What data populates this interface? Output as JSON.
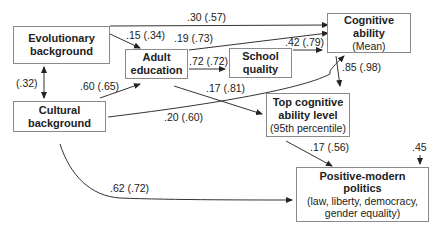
{
  "nodes": {
    "evolutionary": {
      "title_line1": "Evolutionary",
      "title_line2": "background"
    },
    "cultural": {
      "title_line1": "Cultural",
      "title_line2": "background"
    },
    "adult_education": {
      "title_line1": "Adult",
      "title_line2": "education"
    },
    "school_quality": {
      "title_line1": "School",
      "title_line2": "quality"
    },
    "cognitive_ability": {
      "title_line1": "Cognitive",
      "title_line2": "ability",
      "subtitle": "(Mean)"
    },
    "top_cognitive": {
      "title_line1": "Top cognitive",
      "title_line2": "ability level",
      "subtitle": "(95th percentile)"
    },
    "politics": {
      "title_line1": "Positive-modern",
      "title_line2": "politics",
      "subtitle_line1": "(law, liberty, democracy,",
      "subtitle_line2": "gender equality)"
    }
  },
  "edges": [
    {
      "from": "evolutionary",
      "to": "cognitive_ability",
      "label": ".30 (.57)"
    },
    {
      "from": "evolutionary",
      "to": "adult_education",
      "label": ".15 (.34)"
    },
    {
      "from": "adult_education",
      "to": "cognitive_ability",
      "label": ".19 (.73)"
    },
    {
      "from": "evolutionary",
      "to": "cultural",
      "label": "(.32)",
      "bidirectional": true
    },
    {
      "from": "cultural",
      "to": "adult_education",
      "label": ".60 (.65)"
    },
    {
      "from": "adult_education",
      "to": "school_quality",
      "label": ".72 (.72)"
    },
    {
      "from": "school_quality",
      "to": "cognitive_ability",
      "label": ".42 (.79)"
    },
    {
      "from": "adult_education",
      "to": "top_cognitive",
      "label": ".17 (.81)"
    },
    {
      "from": "cultural",
      "to": "cognitive_ability",
      "label": ".20 (.60)"
    },
    {
      "from": "cognitive_ability",
      "to": "top_cognitive",
      "label": ".85 (.98)"
    },
    {
      "from": "top_cognitive",
      "to": "politics",
      "label": ".17 (.56)"
    },
    {
      "from": "cultural",
      "to": "politics",
      "label": ".62 (.72)"
    }
  ],
  "residual": {
    "target": "politics",
    "label": ".45"
  }
}
